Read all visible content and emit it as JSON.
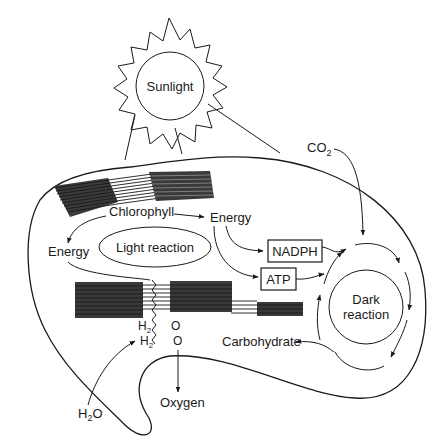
{
  "diagram": {
    "sun": {
      "label": "Sunlight"
    },
    "labels": {
      "chlorophyll": "Chlorophyll",
      "energy_right": "Energy",
      "energy_left": "Energy",
      "light_reaction": "Light reaction",
      "nadph": "NADPH",
      "atp": "ATP",
      "co2": "CO",
      "co2_sub": "2",
      "dark_reaction_line1": "Dark",
      "dark_reaction_line2": "reaction",
      "carbohydrate": "Carbohydrate",
      "h2_top": "H",
      "h2_top_sub": "2",
      "h2_bottom": "H",
      "h2_bottom_sub": "2",
      "o_top": "O",
      "o_bottom": "O",
      "water": "H",
      "water_sub": "2",
      "water_tail": "O",
      "oxygen": "Oxygen"
    },
    "colors": {
      "ink": "#1a1a1a",
      "background": "#ffffff"
    }
  }
}
